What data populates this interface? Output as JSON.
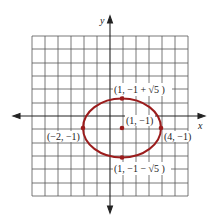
{
  "diagram": {
    "type": "ellipse-on-grid",
    "axes": {
      "x_label": "x",
      "y_label": "y"
    },
    "grid": {
      "unit_px": 13,
      "x_min": -6,
      "x_max": 6,
      "y_min": -6,
      "y_max": 6
    },
    "ellipse": {
      "center": [
        1,
        -1
      ],
      "semi_major_x": 3,
      "semi_minor_y": 2.236,
      "color": "#9b1c1c"
    },
    "points": [
      {
        "id": "center",
        "label": "(1, −1)"
      },
      {
        "id": "left-vertex",
        "label": "(−2, −1)"
      },
      {
        "id": "right-vertex",
        "label": "(4, −1)"
      },
      {
        "id": "top-covertex",
        "label": "(1, −1 + √5 )"
      },
      {
        "id": "bottom-covertex",
        "label": "(1, −1 − √5 )"
      }
    ]
  }
}
